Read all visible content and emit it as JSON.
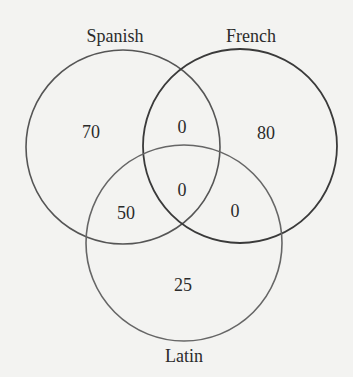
{
  "diagram": {
    "type": "venn-3",
    "sets": [
      {
        "name": "Spanish",
        "cx": 123,
        "cy": 147,
        "r": 97,
        "stroke": "#555555",
        "label_x": 115,
        "label_y": 42
      },
      {
        "name": "French",
        "cx": 240,
        "cy": 146,
        "r": 97,
        "stroke": "#3a3a3a",
        "label_x": 251,
        "label_y": 42
      },
      {
        "name": "Latin",
        "cx": 184,
        "cy": 243,
        "r": 98,
        "stroke": "#666666",
        "label_x": 184,
        "label_y": 362
      }
    ],
    "regions": [
      {
        "id": "spanish_only",
        "label": "70",
        "x": 91,
        "y": 132
      },
      {
        "id": "spanish_french",
        "label": "0",
        "x": 182,
        "y": 127
      },
      {
        "id": "french_only",
        "label": "80",
        "x": 266,
        "y": 133
      },
      {
        "id": "all_three",
        "label": "0",
        "x": 182,
        "y": 190
      },
      {
        "id": "spanish_latin",
        "label": "50",
        "x": 126,
        "y": 213
      },
      {
        "id": "french_latin",
        "label": "0",
        "x": 235,
        "y": 211
      },
      {
        "id": "latin_only",
        "label": "25",
        "x": 183,
        "y": 285
      }
    ]
  },
  "chart_data": {
    "type": "venn",
    "sets": [
      "Spanish",
      "French",
      "Latin"
    ],
    "regions": {
      "Spanish only": 70,
      "French only": 80,
      "Latin only": 25,
      "Spanish & French only": 0,
      "Spanish & Latin only": 50,
      "French & Latin only": 0,
      "Spanish & French & Latin": 0
    }
  }
}
